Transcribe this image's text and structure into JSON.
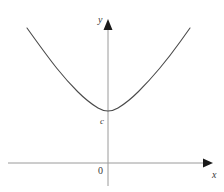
{
  "figure": {
    "title": "",
    "background_color": "#ffffff",
    "width": 224,
    "height": 192
  },
  "axes": {
    "x_axis": {
      "label": "x",
      "color": "#9a9a9a",
      "arrow_color": "#1a1a1a",
      "y_pixel": 163,
      "x_start": 8,
      "x_end": 210
    },
    "y_axis": {
      "label": "y",
      "color": "#9a9a9a",
      "arrow_color": "#1a1a1a",
      "x_pixel": 108,
      "y_start": 22,
      "y_end": 186
    },
    "origin": {
      "label": "0"
    }
  },
  "annotations": {
    "intercept": {
      "label": "c",
      "description": "y-intercept at vertex"
    }
  },
  "chart_data": {
    "type": "line",
    "title": "",
    "xlabel": "x",
    "ylabel": "y",
    "grid": false,
    "legend": null,
    "curve_color": "#4a4a4a",
    "series": [
      {
        "name": "parabola",
        "shape": "parabola-upward",
        "vertex_pixel": [
          108,
          114
        ],
        "x_pixel": [
          27,
          47,
          67,
          88,
          108,
          128,
          149,
          170,
          190
        ],
        "y_pixel": [
          28,
          56,
          81,
          102,
          114,
          102,
          81,
          56,
          28
        ]
      }
    ]
  }
}
